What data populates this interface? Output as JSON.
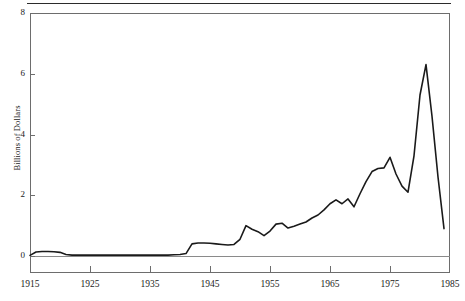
{
  "figure": {
    "top_rule": true,
    "background_color": "#ffffff",
    "line_color": "#1a1a1a",
    "axis_color": "#6d6d6d"
  },
  "chart_data": {
    "type": "line",
    "title": "",
    "subtitle": "",
    "xlabel": "",
    "ylabel": "Billions of Dollars",
    "xlim": [
      1915,
      1985
    ],
    "ylim": [
      0,
      8
    ],
    "grid": false,
    "legend": "none",
    "xticks": [
      1915,
      1925,
      1935,
      1945,
      1955,
      1965,
      1975,
      1985
    ],
    "xtick_labels": [
      "1915",
      "1925",
      "1935",
      "1945",
      "1955",
      "1965",
      "1975",
      "1985"
    ],
    "yticks": [
      0,
      2,
      4,
      6,
      8
    ],
    "ytick_labels": [
      "0",
      "2",
      "4",
      "6",
      "8"
    ],
    "series": [
      {
        "name": "Billions of Dollars",
        "color": "#1a1a1a",
        "x": [
          1915,
          1916,
          1917,
          1918,
          1919,
          1920,
          1921,
          1922,
          1923,
          1924,
          1925,
          1926,
          1927,
          1928,
          1929,
          1930,
          1931,
          1932,
          1933,
          1934,
          1935,
          1936,
          1937,
          1938,
          1939,
          1940,
          1941,
          1942,
          1943,
          1944,
          1945,
          1946,
          1947,
          1948,
          1949,
          1950,
          1951,
          1952,
          1953,
          1954,
          1955,
          1956,
          1957,
          1958,
          1959,
          1960,
          1961,
          1962,
          1963,
          1964,
          1965,
          1966,
          1967,
          1968,
          1969,
          1970,
          1971,
          1972,
          1973,
          1974,
          1975,
          1976,
          1977,
          1978,
          1979,
          1980,
          1981,
          1982,
          1983,
          1984
        ],
        "y": [
          0.02,
          0.13,
          0.15,
          0.15,
          0.14,
          0.12,
          0.05,
          0.03,
          0.03,
          0.03,
          0.03,
          0.03,
          0.03,
          0.03,
          0.03,
          0.03,
          0.03,
          0.03,
          0.03,
          0.03,
          0.03,
          0.03,
          0.03,
          0.03,
          0.04,
          0.05,
          0.08,
          0.4,
          0.43,
          0.43,
          0.42,
          0.4,
          0.38,
          0.36,
          0.38,
          0.55,
          1.0,
          0.88,
          0.8,
          0.67,
          0.82,
          1.05,
          1.08,
          0.92,
          0.98,
          1.05,
          1.12,
          1.25,
          1.35,
          1.52,
          1.72,
          1.85,
          1.72,
          1.88,
          1.62,
          2.05,
          2.45,
          2.78,
          2.88,
          2.9,
          3.25,
          2.7,
          2.3,
          2.1,
          3.3,
          5.3,
          6.3,
          4.6,
          2.6,
          0.9
        ]
      }
    ]
  }
}
